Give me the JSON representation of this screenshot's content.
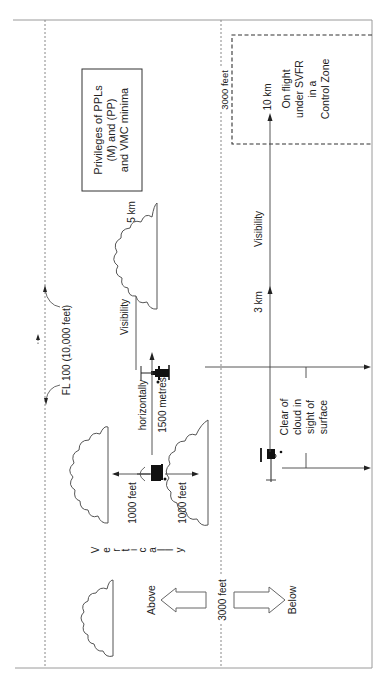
{
  "diagram": {
    "title_box": {
      "line1": "Privileges of PPLs",
      "line2": "(M) and (PP)",
      "line3": "and VMC minima"
    },
    "levels": {
      "fl100": "FL 100 (10,000 feet)",
      "alt3000_top": "3000 feet",
      "alt3000_mid": "3000 feet"
    },
    "svfr_box": {
      "line1": "On flight",
      "line2": "under SVFR",
      "line3": "in a",
      "line4": "Control Zone"
    },
    "visibility": {
      "label_5km_section": "Visibility",
      "value_5km": "5 km",
      "label_svfr": "Visibility",
      "value_10km": "10 km",
      "value_3km": "3 km"
    },
    "separation": {
      "horizontally": "horizontally",
      "horizontal_value": "1500 metres",
      "vertical_above": "1000 feet",
      "vertical_below": "1000 feet",
      "vertically_letters": [
        "V",
        "e",
        "r",
        "t",
        "i",
        "c",
        "a",
        "l",
        "l",
        "y"
      ]
    },
    "clear_of_cloud": {
      "line1": "Clear of",
      "line2": "cloud in",
      "line3": "sight of",
      "line4": "surface"
    },
    "arrows": {
      "above": "Above",
      "below": "Below"
    },
    "colors": {
      "frame": "#9a9a9a",
      "ink": "#222222",
      "background": "#ffffff"
    }
  }
}
